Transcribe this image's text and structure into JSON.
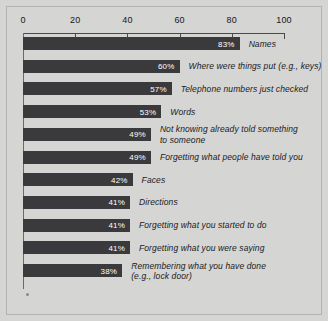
{
  "chart_data": {
    "type": "bar",
    "orientation": "horizontal",
    "title": "",
    "subtitle": "",
    "xlabel": "",
    "ylabel": "",
    "xlim": [
      0,
      100
    ],
    "xticks": [
      0,
      20,
      40,
      60,
      80,
      100
    ],
    "xtick_labels": [
      "0",
      "20",
      "40",
      "60",
      "80",
      "100"
    ],
    "grid": false,
    "legend": false,
    "value_suffix": "%",
    "categories": [
      "Names",
      "Where were things put (e.g., keys)",
      "Telephone numbers just checked",
      "Words",
      "Not knowing already told something\nto someone",
      "Forgetting what people have told you",
      "Faces",
      "Directions",
      "Forgetting what you started to do",
      "Forgetting what you were saying",
      "Remembering what you have done\n(e.g., lock door)"
    ],
    "values": [
      83,
      60,
      57,
      53,
      49,
      49,
      42,
      41,
      41,
      41,
      38
    ],
    "value_labels": [
      "83%",
      "60%",
      "57%",
      "53%",
      "49%",
      "49%",
      "42%",
      "41%",
      "41%",
      "41%",
      "38%"
    ]
  },
  "style": {
    "background_color": "#d5d5d3",
    "bar_color": "#3a3a3c",
    "value_text_color": "#ffffff",
    "label_text_color": "#1b1b1e",
    "axis_color": "#4a4a4a",
    "border_color": "#b2b2ae"
  }
}
